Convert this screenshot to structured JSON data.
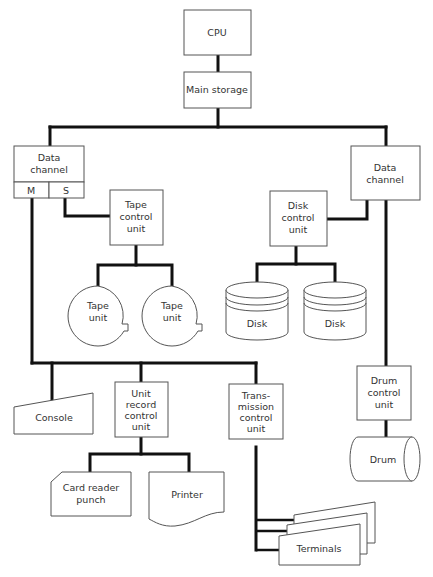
{
  "diagram": {
    "nodes": {
      "cpu": {
        "label": "CPU"
      },
      "main_storage": {
        "label": "Main storage"
      },
      "data_channel_left": {
        "line1": "Data",
        "line2": "channel",
        "port_m": "M",
        "port_s": "S"
      },
      "data_channel_right": {
        "line1": "Data",
        "line2": "channel"
      },
      "tape_control": {
        "line1": "Tape",
        "line2": "control",
        "line3": "unit"
      },
      "tape_unit_1": {
        "line1": "Tape",
        "line2": "unit"
      },
      "tape_unit_2": {
        "line1": "Tape",
        "line2": "unit"
      },
      "disk_control": {
        "line1": "Disk",
        "line2": "control",
        "line3": "unit"
      },
      "disk_1": {
        "label": "Disk"
      },
      "disk_2": {
        "label": "Disk"
      },
      "console": {
        "label": "Console"
      },
      "unit_record_control": {
        "line1": "Unit",
        "line2": "record",
        "line3": "control",
        "line4": "unit"
      },
      "transmission_control": {
        "line1": "Trans-",
        "line2": "mission",
        "line3": "control",
        "line4": "unit"
      },
      "drum_control": {
        "line1": "Drum",
        "line2": "control",
        "line3": "unit"
      },
      "drum": {
        "label": "Drum"
      },
      "card_reader": {
        "line1": "Card reader",
        "line2": "punch"
      },
      "printer": {
        "label": "Printer"
      },
      "terminals": {
        "label": "Terminals"
      }
    },
    "edges": [
      [
        "CPU",
        "Main storage"
      ],
      [
        "Main storage",
        "Data channel (left)"
      ],
      [
        "Main storage",
        "Data channel (right)"
      ],
      [
        "Data channel (left) S",
        "Tape control unit"
      ],
      [
        "Tape control unit",
        "Tape unit"
      ],
      [
        "Tape control unit",
        "Tape unit"
      ],
      [
        "Data channel (right)",
        "Disk control unit"
      ],
      [
        "Disk control unit",
        "Disk"
      ],
      [
        "Disk control unit",
        "Disk"
      ],
      [
        "Data channel (left) M",
        "Console"
      ],
      [
        "Data channel (left) M",
        "Unit record control unit"
      ],
      [
        "Data channel (left) M",
        "Transmission control unit"
      ],
      [
        "Unit record control unit",
        "Card reader punch"
      ],
      [
        "Unit record control unit",
        "Printer"
      ],
      [
        "Transmission control unit",
        "Terminals"
      ],
      [
        "Data channel (right)",
        "Drum control unit"
      ],
      [
        "Drum control unit",
        "Drum"
      ]
    ]
  }
}
